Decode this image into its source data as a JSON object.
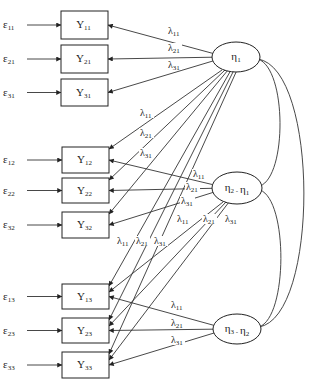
{
  "diagram": {
    "type": "path-diagram / latent growth model",
    "observed": [
      {
        "id": "Y11",
        "label": "Y",
        "sub": "11",
        "x": 61,
        "y": 11,
        "w": 47,
        "h": 28,
        "error": {
          "label": "ε",
          "sub": "11"
        }
      },
      {
        "id": "Y21",
        "label": "Y",
        "sub": "21",
        "x": 61,
        "y": 45,
        "w": 47,
        "h": 28,
        "error": {
          "label": "ε",
          "sub": "21"
        }
      },
      {
        "id": "Y31",
        "label": "Y",
        "sub": "31",
        "x": 61,
        "y": 79,
        "w": 47,
        "h": 27,
        "error": {
          "label": "ε",
          "sub": "31"
        }
      },
      {
        "id": "Y12",
        "label": "Y",
        "sub": "12",
        "x": 62,
        "y": 147,
        "w": 47,
        "h": 26,
        "error": {
          "label": "ε",
          "sub": "12"
        }
      },
      {
        "id": "Y22",
        "label": "Y",
        "sub": "22",
        "x": 62,
        "y": 178,
        "w": 47,
        "h": 25,
        "error": {
          "label": "ε",
          "sub": "22"
        }
      },
      {
        "id": "Y32",
        "label": "Y",
        "sub": "32",
        "x": 62,
        "y": 212,
        "w": 47,
        "h": 26,
        "error": {
          "label": "ε",
          "sub": "32"
        }
      },
      {
        "id": "Y13",
        "label": "Y",
        "sub": "13",
        "x": 62,
        "y": 284,
        "w": 47,
        "h": 25,
        "error": {
          "label": "ε",
          "sub": "13"
        }
      },
      {
        "id": "Y23",
        "label": "Y",
        "sub": "23",
        "x": 62,
        "y": 318,
        "w": 47,
        "h": 25,
        "error": {
          "label": "ε",
          "sub": "23"
        }
      },
      {
        "id": "Y33",
        "label": "Y",
        "sub": "33",
        "x": 62,
        "y": 352,
        "w": 47,
        "h": 26,
        "error": {
          "label": "ε",
          "sub": "33"
        }
      }
    ],
    "latent": [
      {
        "id": "eta1",
        "label": "η",
        "sub": "1",
        "text": "η1",
        "cx": 236,
        "cy": 57,
        "rx": 24,
        "ry": 15
      },
      {
        "id": "eta2_eta1",
        "label": "η",
        "sub": "2 - η1",
        "text": "η2 - η1",
        "cx": 237,
        "cy": 188,
        "rx": 25,
        "ry": 16
      },
      {
        "id": "eta3_eta2",
        "label": "η",
        "sub": "3 - η2",
        "text": "η3 - η2",
        "cx": 237,
        "cy": 329,
        "rx": 24,
        "ry": 15
      }
    ],
    "loadings": [
      {
        "from": "eta1",
        "to": "Y11",
        "label": "λ11"
      },
      {
        "from": "eta1",
        "to": "Y21",
        "label": "λ21"
      },
      {
        "from": "eta1",
        "to": "Y31",
        "label": "λ31"
      },
      {
        "from": "eta1",
        "to": "Y12",
        "label": "λ11"
      },
      {
        "from": "eta1",
        "to": "Y22",
        "label": "λ21"
      },
      {
        "from": "eta1",
        "to": "Y32",
        "label": "λ31"
      },
      {
        "from": "eta1",
        "to": "Y13",
        "label": ""
      },
      {
        "from": "eta1",
        "to": "Y23",
        "label": ""
      },
      {
        "from": "eta1",
        "to": "Y33",
        "label": ""
      },
      {
        "from": "eta2_eta1",
        "to": "Y12",
        "label": "λ11"
      },
      {
        "from": "eta2_eta1",
        "to": "Y22",
        "label": "λ21"
      },
      {
        "from": "eta2_eta1",
        "to": "Y32",
        "label": "λ31"
      },
      {
        "from": "eta2_eta1",
        "to": "Y13",
        "label": "λ11"
      },
      {
        "from": "eta2_eta1",
        "to": "Y23",
        "label": "λ21"
      },
      {
        "from": "eta2_eta1",
        "to": "Y33",
        "label": "λ31"
      },
      {
        "from": "eta3_eta2",
        "to": "Y13",
        "label": "λ11"
      },
      {
        "from": "eta3_eta2",
        "to": "Y23",
        "label": "λ21"
      },
      {
        "from": "eta3_eta2",
        "to": "Y33",
        "label": "λ31"
      }
    ],
    "loading_labels": [
      {
        "text": "λ",
        "sub": "11",
        "x": 168,
        "y": 34
      },
      {
        "text": "λ",
        "sub": "21",
        "x": 168,
        "y": 51
      },
      {
        "text": "λ",
        "sub": "31",
        "x": 168,
        "y": 68
      },
      {
        "text": "λ",
        "sub": "11",
        "x": 140,
        "y": 116
      },
      {
        "text": "λ",
        "sub": "21",
        "x": 140,
        "y": 136
      },
      {
        "text": "λ",
        "sub": "31",
        "x": 140,
        "y": 156
      },
      {
        "text": "λ",
        "sub": "11",
        "x": 193,
        "y": 177
      },
      {
        "text": "λ",
        "sub": "21",
        "x": 186,
        "y": 190
      },
      {
        "text": "λ",
        "sub": "31",
        "x": 181,
        "y": 204
      },
      {
        "text": "λ",
        "sub": "11",
        "x": 177,
        "y": 222
      },
      {
        "text": "λ",
        "sub": "21",
        "x": 203,
        "y": 222
      },
      {
        "text": "λ",
        "sub": "31",
        "x": 225,
        "y": 222
      },
      {
        "text": "λ",
        "sub": "11",
        "x": 117,
        "y": 244
      },
      {
        "text": "λ",
        "sub": "21",
        "x": 136,
        "y": 244
      },
      {
        "text": "λ",
        "sub": "31",
        "x": 154,
        "y": 244
      },
      {
        "text": "λ",
        "sub": "11",
        "x": 171,
        "y": 308
      },
      {
        "text": "λ",
        "sub": "21",
        "x": 171,
        "y": 326
      },
      {
        "text": "λ",
        "sub": "31",
        "x": 171,
        "y": 343
      }
    ],
    "covariances": [
      {
        "from": "eta1",
        "to": "eta2_eta1",
        "bulge_x": 283
      },
      {
        "from": "eta2_eta1",
        "to": "eta3_eta2",
        "bulge_x": 284
      },
      {
        "from": "eta1",
        "to": "eta3_eta2",
        "bulge_x": 315
      }
    ],
    "colors": {
      "stroke": "#222222",
      "line": "#333333",
      "background": "#ffffff"
    }
  }
}
